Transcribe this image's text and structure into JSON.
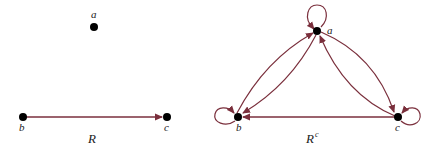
{
  "colors": {
    "edge": "#7a2f3c",
    "node": "#000000",
    "background": "#ffffff"
  },
  "graphs": [
    {
      "name": "R",
      "caption": "R",
      "nodes": [
        {
          "id": "a",
          "label": "a",
          "x": 94,
          "y": 27
        },
        {
          "id": "b",
          "label": "b",
          "x": 23,
          "y": 117
        },
        {
          "id": "c",
          "label": "c",
          "x": 167,
          "y": 117
        }
      ],
      "edges": [
        {
          "from": "b",
          "to": "c"
        }
      ]
    },
    {
      "name": "R-complement",
      "caption": "R",
      "caption_superscript": "c",
      "nodes": [
        {
          "id": "a",
          "label": "a",
          "x": 317,
          "y": 31
        },
        {
          "id": "b",
          "label": "b",
          "x": 238,
          "y": 117
        },
        {
          "id": "c",
          "label": "c",
          "x": 398,
          "y": 117
        }
      ],
      "edges": [
        {
          "from": "a",
          "to": "a",
          "loop": true
        },
        {
          "from": "b",
          "to": "b",
          "loop": true
        },
        {
          "from": "c",
          "to": "c",
          "loop": true
        },
        {
          "from": "a",
          "to": "b"
        },
        {
          "from": "b",
          "to": "a"
        },
        {
          "from": "a",
          "to": "c"
        },
        {
          "from": "c",
          "to": "a"
        },
        {
          "from": "c",
          "to": "b"
        }
      ]
    }
  ]
}
